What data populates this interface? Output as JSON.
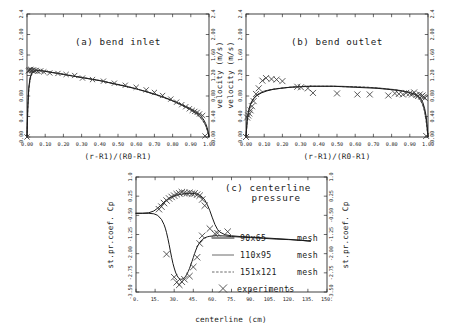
{
  "figure": {
    "background": "#ffffff",
    "ink": "#1a1a1a"
  },
  "chart_data": [
    {
      "id": "panel_a",
      "type": "line",
      "title": "(a) bend inlet",
      "xlabel": "(r-R1)/(R0-R1)",
      "ylabel": "velocity (m/s)",
      "ylabel_side": "right",
      "xlim": [
        0.0,
        1.0
      ],
      "ylim": [
        0.0,
        2.4
      ],
      "grid": false,
      "xticks": [
        "0.00",
        "0.10",
        "0.20",
        "0.30",
        "0.40",
        "0.50",
        "0.60",
        "0.70",
        "0.80",
        "0.90",
        "1.00"
      ],
      "xtick_values": [
        0.0,
        0.1,
        0.2,
        0.3,
        0.4,
        0.5,
        0.6,
        0.7,
        0.8,
        0.9,
        1.0
      ],
      "yticks": [
        "0.00",
        "0.40",
        "0.80",
        "1.20",
        "1.60",
        "2.00",
        "2.4"
      ],
      "ytick_values": [
        0.0,
        0.4,
        0.8,
        1.2,
        1.6,
        2.0,
        2.4
      ],
      "series": [
        {
          "name": "90x65 mesh",
          "style": "solid",
          "x": [
            0.0,
            0.004,
            0.009,
            0.016,
            0.025,
            0.04,
            0.06,
            0.08,
            0.1,
            0.15,
            0.2,
            0.25,
            0.3,
            0.35,
            0.4,
            0.45,
            0.5,
            0.55,
            0.6,
            0.65,
            0.7,
            0.75,
            0.8,
            0.84,
            0.87,
            0.9,
            0.925,
            0.945,
            0.96,
            0.972,
            0.982,
            0.99,
            0.996,
            1.0
          ],
          "y": [
            0.0,
            0.52,
            0.92,
            1.14,
            1.24,
            1.29,
            1.3,
            1.29,
            1.28,
            1.25,
            1.22,
            1.19,
            1.16,
            1.13,
            1.1,
            1.06,
            1.02,
            0.98,
            0.94,
            0.89,
            0.84,
            0.78,
            0.71,
            0.65,
            0.6,
            0.55,
            0.49,
            0.44,
            0.39,
            0.33,
            0.26,
            0.18,
            0.09,
            0.0
          ]
        },
        {
          "name": "110x95 mesh",
          "style": "solid-thin",
          "x": [
            0.0,
            0.004,
            0.01,
            0.018,
            0.028,
            0.045,
            0.065,
            0.09,
            0.12,
            0.18,
            0.25,
            0.32,
            0.4,
            0.48,
            0.56,
            0.64,
            0.72,
            0.79,
            0.85,
            0.9,
            0.94,
            0.965,
            0.982,
            0.992,
            1.0
          ],
          "y": [
            0.0,
            0.56,
            0.96,
            1.16,
            1.26,
            1.3,
            1.3,
            1.29,
            1.27,
            1.24,
            1.19,
            1.15,
            1.1,
            1.04,
            0.98,
            0.9,
            0.81,
            0.72,
            0.62,
            0.53,
            0.43,
            0.33,
            0.22,
            0.12,
            0.0
          ]
        },
        {
          "name": "151x121 mesh",
          "style": "dashed",
          "x": [
            0.0,
            0.005,
            0.012,
            0.022,
            0.035,
            0.055,
            0.08,
            0.11,
            0.16,
            0.23,
            0.31,
            0.39,
            0.47,
            0.55,
            0.63,
            0.71,
            0.78,
            0.84,
            0.89,
            0.93,
            0.96,
            0.98,
            0.993,
            1.0
          ],
          "y": [
            0.0,
            0.62,
            1.0,
            1.19,
            1.27,
            1.3,
            1.3,
            1.28,
            1.25,
            1.21,
            1.16,
            1.11,
            1.05,
            0.99,
            0.91,
            0.82,
            0.73,
            0.64,
            0.55,
            0.45,
            0.35,
            0.24,
            0.1,
            0.0
          ]
        }
      ],
      "experiments": {
        "name": "experiments",
        "marker": "x",
        "x": [
          0.0,
          0.008,
          0.012,
          0.016,
          0.02,
          0.025,
          0.03,
          0.036,
          0.042,
          0.05,
          0.06,
          0.075,
          0.092,
          0.125,
          0.17,
          0.215,
          0.262,
          0.305,
          0.36,
          0.42,
          0.48,
          0.54,
          0.6,
          0.655,
          0.7,
          0.745,
          0.79,
          0.822,
          0.85,
          0.872,
          0.892,
          0.908,
          0.922,
          0.935,
          0.948,
          0.965,
          0.978
        ],
        "y": [
          0.0,
          1.29,
          1.31,
          1.3,
          1.32,
          1.3,
          1.29,
          1.31,
          1.29,
          1.3,
          1.28,
          1.29,
          1.27,
          1.25,
          1.24,
          1.22,
          1.2,
          1.15,
          1.12,
          1.09,
          1.05,
          1.01,
          0.97,
          0.92,
          0.87,
          0.81,
          0.74,
          0.68,
          0.63,
          0.59,
          0.55,
          0.52,
          0.5,
          0.48,
          0.45,
          0.42,
          0.02
        ]
      }
    },
    {
      "id": "panel_b",
      "type": "line",
      "title": "(b) bend outlet",
      "xlabel": "(r-R1)/(R0-R1)",
      "ylabel": "velocity (m/s)",
      "ylabel_side": "left",
      "xlim": [
        0.0,
        1.0
      ],
      "ylim": [
        0.0,
        2.4
      ],
      "grid": false,
      "xticks": [
        "0.00",
        "0.10",
        "0.20",
        "0.30",
        "0.40",
        "0.50",
        "0.60",
        "0.70",
        "0.80",
        "0.90",
        "1.00"
      ],
      "xtick_values": [
        0.0,
        0.1,
        0.2,
        0.3,
        0.4,
        0.5,
        0.6,
        0.7,
        0.8,
        0.9,
        1.0
      ],
      "yticks": [
        "0.00",
        "0.40",
        "0.80",
        "1.20",
        "1.60",
        "2.00",
        "2.4"
      ],
      "ytick_values": [
        0.0,
        0.4,
        0.8,
        1.2,
        1.6,
        2.0,
        2.4
      ],
      "series": [
        {
          "name": "90x65 mesh",
          "style": "solid",
          "x": [
            0.0,
            0.006,
            0.014,
            0.025,
            0.04,
            0.06,
            0.085,
            0.115,
            0.15,
            0.19,
            0.24,
            0.3,
            0.36,
            0.42,
            0.48,
            0.54,
            0.6,
            0.66,
            0.72,
            0.78,
            0.83,
            0.87,
            0.9,
            0.925,
            0.945,
            0.96,
            0.972,
            0.982,
            0.99,
            0.996,
            1.0
          ],
          "y": [
            0.0,
            0.31,
            0.5,
            0.64,
            0.74,
            0.81,
            0.86,
            0.9,
            0.93,
            0.95,
            0.97,
            0.98,
            0.99,
            0.99,
            0.99,
            0.98,
            0.97,
            0.96,
            0.95,
            0.93,
            0.91,
            0.89,
            0.87,
            0.84,
            0.8,
            0.75,
            0.67,
            0.55,
            0.4,
            0.2,
            0.0
          ]
        },
        {
          "name": "110x95 mesh",
          "style": "solid-thin",
          "x": [
            0.0,
            0.007,
            0.016,
            0.028,
            0.045,
            0.068,
            0.095,
            0.128,
            0.168,
            0.215,
            0.27,
            0.33,
            0.395,
            0.46,
            0.525,
            0.59,
            0.655,
            0.718,
            0.778,
            0.83,
            0.872,
            0.905,
            0.932,
            0.952,
            0.968,
            0.98,
            0.99,
            1.0
          ],
          "y": [
            0.0,
            0.34,
            0.53,
            0.67,
            0.77,
            0.84,
            0.89,
            0.92,
            0.94,
            0.96,
            0.98,
            0.99,
            0.99,
            0.99,
            0.99,
            0.98,
            0.97,
            0.96,
            0.94,
            0.92,
            0.89,
            0.86,
            0.82,
            0.76,
            0.66,
            0.52,
            0.32,
            0.0
          ]
        },
        {
          "name": "151x121 mesh",
          "style": "dashed",
          "x": [
            0.0,
            0.008,
            0.018,
            0.032,
            0.05,
            0.075,
            0.105,
            0.14,
            0.182,
            0.232,
            0.288,
            0.35,
            0.415,
            0.48,
            0.545,
            0.61,
            0.675,
            0.735,
            0.792,
            0.84,
            0.88,
            0.912,
            0.938,
            0.958,
            0.974,
            0.986,
            1.0
          ],
          "y": [
            0.0,
            0.37,
            0.56,
            0.7,
            0.79,
            0.86,
            0.9,
            0.93,
            0.95,
            0.97,
            0.98,
            0.99,
            0.99,
            0.99,
            0.98,
            0.98,
            0.97,
            0.95,
            0.93,
            0.91,
            0.88,
            0.84,
            0.79,
            0.72,
            0.6,
            0.42,
            0.0
          ]
        }
      ],
      "experiments": {
        "name": "experiments",
        "marker": "x",
        "x": [
          0.0,
          0.006,
          0.012,
          0.018,
          0.025,
          0.033,
          0.042,
          0.055,
          0.07,
          0.09,
          0.11,
          0.14,
          0.168,
          0.2,
          0.282,
          0.302,
          0.34,
          0.368,
          0.5,
          0.612,
          0.68,
          0.782,
          0.818,
          0.84,
          0.862,
          0.88,
          0.898,
          0.912,
          0.924,
          0.936,
          0.946,
          0.955,
          0.963,
          0.97,
          0.976,
          0.983,
          0.99
        ],
        "y": [
          0.0,
          0.38,
          0.42,
          0.46,
          0.52,
          0.6,
          0.7,
          0.84,
          0.95,
          1.1,
          1.15,
          1.13,
          1.12,
          1.09,
          0.98,
          0.97,
          0.95,
          0.86,
          0.85,
          0.83,
          0.83,
          0.81,
          0.85,
          0.84,
          0.83,
          0.86,
          0.85,
          0.83,
          0.87,
          0.82,
          0.8,
          0.83,
          0.79,
          0.81,
          0.78,
          0.76,
          0.02
        ]
      }
    },
    {
      "id": "panel_c",
      "type": "line",
      "title_line1": "(c) centerline",
      "title_line2": "pressure",
      "xlabel": "centerline (cm)",
      "ylabel": "st.pr.coef. Cp",
      "ylabel_side": "both",
      "xlim": [
        0.0,
        150.0
      ],
      "ylim": [
        -3.5,
        1.0
      ],
      "grid": false,
      "xticks": [
        "0.",
        "15.",
        "30.",
        "45.",
        "60.",
        "75.",
        "90.",
        "105.",
        "120.",
        "135.",
        "150."
      ],
      "xtick_values": [
        0,
        15,
        30,
        45,
        60,
        75,
        90,
        105,
        120,
        135,
        150
      ],
      "yticks": [
        "1.0",
        "0.25",
        "-0.50",
        "-1.25",
        "-2.00",
        "-2.75",
        "-3.50"
      ],
      "ytick_values": [
        1.0,
        0.25,
        -0.5,
        -1.25,
        -2.0,
        -2.75,
        -3.5
      ],
      "series": [
        {
          "name": "inner-wall-90x65",
          "style": "solid",
          "branch": "upper",
          "x": [
            0,
            5,
            10,
            14,
            17,
            20,
            22,
            24,
            26,
            28,
            30,
            32,
            34,
            36,
            38,
            40,
            42,
            44,
            46,
            48,
            50,
            52,
            54,
            56,
            58,
            60,
            62,
            64,
            66,
            70,
            75,
            82,
            90,
            100,
            110,
            120,
            130,
            137
          ],
          "y": [
            -0.42,
            -0.42,
            -0.4,
            -0.33,
            -0.22,
            -0.08,
            0.02,
            0.1,
            0.17,
            0.22,
            0.26,
            0.29,
            0.31,
            0.33,
            0.35,
            0.36,
            0.36,
            0.36,
            0.35,
            0.33,
            0.29,
            0.22,
            0.1,
            -0.08,
            -0.32,
            -0.6,
            -0.86,
            -1.05,
            -1.16,
            -1.26,
            -1.3,
            -1.33,
            -1.35,
            -1.38,
            -1.41,
            -1.44,
            -1.48,
            -1.51
          ]
        },
        {
          "name": "outer-wall-90x65",
          "style": "solid",
          "branch": "lower",
          "x": [
            0,
            5,
            10,
            14,
            17,
            20,
            22,
            23,
            24,
            25,
            26,
            27,
            28,
            29,
            30,
            31,
            32,
            33,
            34,
            35,
            36,
            37,
            38,
            39,
            40,
            41,
            42,
            43,
            44,
            45,
            46,
            47,
            48,
            50,
            52,
            54,
            56,
            58,
            60,
            62,
            64,
            66,
            70,
            75,
            82,
            90,
            100,
            110,
            120,
            130,
            137
          ],
          "y": [
            -0.42,
            -0.42,
            -0.42,
            -0.44,
            -0.5,
            -0.66,
            -0.86,
            -1.0,
            -1.18,
            -1.4,
            -1.64,
            -1.9,
            -2.15,
            -2.38,
            -2.56,
            -2.72,
            -2.84,
            -2.92,
            -2.97,
            -3.0,
            -3.0,
            -2.98,
            -2.94,
            -2.88,
            -2.8,
            -2.7,
            -2.58,
            -2.44,
            -2.3,
            -2.15,
            -2.0,
            -1.86,
            -1.74,
            -1.56,
            -1.45,
            -1.38,
            -1.34,
            -1.32,
            -1.31,
            -1.3,
            -1.3,
            -1.3,
            -1.31,
            -1.33,
            -1.35,
            -1.37,
            -1.4,
            -1.43,
            -1.45,
            -1.48,
            -1.51
          ]
        }
      ],
      "experiments": {
        "name": "experiments",
        "marker": "x",
        "x": [
          18,
          20,
          22,
          24,
          26,
          28,
          30,
          32,
          34,
          36,
          38,
          40,
          42,
          44,
          46,
          48,
          50,
          52,
          54,
          58,
          62,
          64,
          72,
          24,
          30,
          32,
          34,
          36,
          38,
          42,
          45,
          48,
          50,
          52
        ],
        "y": [
          -0.26,
          -0.16,
          -0.02,
          0.08,
          0.16,
          0.22,
          0.27,
          0.33,
          0.36,
          0.41,
          0.38,
          0.36,
          0.38,
          0.35,
          0.36,
          0.31,
          0.27,
          0.12,
          -0.12,
          -1.02,
          -1.22,
          -1.2,
          -1.14,
          -2.02,
          -2.92,
          -3.12,
          -3.22,
          -3.1,
          -3.0,
          -2.88,
          -2.52,
          -2.14,
          -1.6,
          -1.3
        ]
      },
      "legend": {
        "position": "inside-center",
        "entries": [
          {
            "label": "90x65",
            "suffix": "mesh",
            "style": "solid"
          },
          {
            "label": "110x95",
            "suffix": "mesh",
            "style": "solid-thin"
          },
          {
            "label": "151x121",
            "suffix": "mesh",
            "style": "dashed"
          },
          {
            "label": "experiments",
            "suffix": "",
            "style": "marker-x"
          }
        ]
      }
    }
  ]
}
